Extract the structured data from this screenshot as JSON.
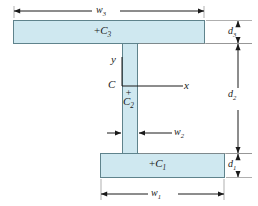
{
  "figure": {
    "kind": "engineering-cross-section",
    "background_color": "#ffffff",
    "fill_color": "#cfe8f0",
    "outline_color": "#5a7d86",
    "line_color": "#1a1a1a"
  },
  "shapes": {
    "top_flange": {
      "label_prefix": "+",
      "label_base": "C",
      "label_sub": "3",
      "x": 13,
      "y": 20,
      "width": 192,
      "height": 24
    },
    "web": {
      "label_prefix": "+",
      "label_base": "C",
      "label_sub": "2",
      "x": 122,
      "y": 44,
      "width": 16,
      "height": 109
    },
    "bottom_flange": {
      "label_prefix": "+",
      "label_base": "C",
      "label_sub": "1",
      "x": 100,
      "y": 153,
      "width": 125,
      "height": 25
    }
  },
  "axes": {
    "origin_label": "C",
    "vertical_label": "y",
    "horizontal_label": "x",
    "origin_x": 122,
    "origin_y": 86
  },
  "dimensions": [
    {
      "name": "top-flange-width",
      "base": "w",
      "sub": "3",
      "orientation": "horizontal",
      "position": "top"
    },
    {
      "name": "top-flange-depth",
      "base": "d",
      "sub": "3",
      "orientation": "vertical",
      "position": "right"
    },
    {
      "name": "web-depth",
      "base": "d",
      "sub": "2",
      "orientation": "vertical",
      "position": "right"
    },
    {
      "name": "bottom-flange-depth",
      "base": "d",
      "sub": "1",
      "orientation": "vertical",
      "position": "right"
    },
    {
      "name": "web-width",
      "base": "w",
      "sub": "2",
      "orientation": "horizontal",
      "position": "middle"
    },
    {
      "name": "bottom-flange-width",
      "base": "w",
      "sub": "1",
      "orientation": "horizontal",
      "position": "bottom"
    }
  ]
}
